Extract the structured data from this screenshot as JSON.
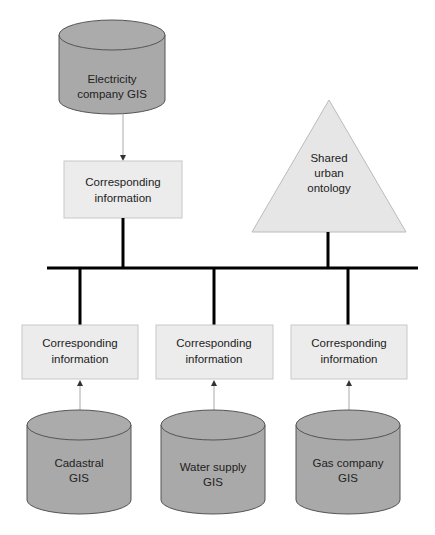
{
  "diagram": {
    "databases": [
      {
        "id": "electricity",
        "line1": "Electricity",
        "line2": "company GIS"
      },
      {
        "id": "cadastral",
        "line1": "Cadastral",
        "line2": "GIS"
      },
      {
        "id": "water",
        "line1": "Water supply",
        "line2": "GIS"
      },
      {
        "id": "gas",
        "line1": "Gas company",
        "line2": "GIS"
      }
    ],
    "boxes": [
      {
        "id": "top",
        "line1": "Corresponding",
        "line2": "information"
      },
      {
        "id": "left",
        "line1": "Corresponding",
        "line2": "information"
      },
      {
        "id": "mid",
        "line1": "Corresponding",
        "line2": "information"
      },
      {
        "id": "right",
        "line1": "Corresponding",
        "line2": "information"
      }
    ],
    "ontology": {
      "line1": "Shared",
      "line2": "urban",
      "line3": "ontology"
    },
    "colors": {
      "cylinder": "#a9a9a9",
      "box": "#ececec",
      "triangle": "#e6e6e6",
      "bus": "#000000",
      "arrow": "#aaaaaa"
    }
  }
}
